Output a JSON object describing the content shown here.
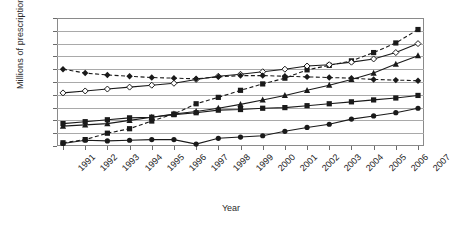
{
  "chart_data": {
    "type": "line",
    "title": "",
    "xlabel": "Year",
    "ylabel": "Millions of prescriptions",
    "grid": true,
    "legend": "none",
    "xlim": [
      1991,
      2007
    ],
    "ylim": [
      0,
      20
    ],
    "ytick_step": 2,
    "yticks": [
      0,
      2,
      4,
      6,
      8,
      10,
      12,
      14,
      16,
      18,
      20
    ],
    "categories": [
      1991,
      1992,
      1993,
      1994,
      1995,
      1996,
      1997,
      1998,
      1999,
      2000,
      2001,
      2002,
      2003,
      2004,
      2005,
      2006,
      2007
    ],
    "xtick_labels": [
      "1991",
      "1992",
      "1993",
      "1994",
      "1995",
      "1996",
      "1997",
      "1998",
      "1999",
      "2000",
      "2001",
      "2002",
      "2003",
      "2004",
      "2005",
      "2006",
      "2007"
    ],
    "series": [
      {
        "name": "series-1",
        "marker": "filled-square",
        "line": "dashed",
        "color": "#1a1a1a",
        "values": [
          0.5,
          1.0,
          2.0,
          2.7,
          3.9,
          5.0,
          6.6,
          7.6,
          8.7,
          9.7,
          10.6,
          11.9,
          12.6,
          13.3,
          14.6,
          16.1,
          18.2
        ]
      },
      {
        "name": "series-2",
        "marker": "open-diamond",
        "line": "solid",
        "color": "#1a1a1a",
        "values": [
          8.3,
          8.6,
          8.9,
          9.2,
          9.5,
          9.8,
          10.4,
          10.9,
          11.2,
          11.6,
          12.0,
          12.5,
          12.7,
          13.1,
          13.6,
          14.6,
          16.0
        ]
      },
      {
        "name": "series-3",
        "marker": "filled-triangle",
        "line": "solid",
        "color": "#1a1a1a",
        "values": [
          3.1,
          3.3,
          3.5,
          4.0,
          4.5,
          5.0,
          5.4,
          5.9,
          6.5,
          7.2,
          7.9,
          8.7,
          9.5,
          10.4,
          11.4,
          12.8,
          14.1
        ]
      },
      {
        "name": "series-4",
        "marker": "filled-diamond",
        "line": "dashed",
        "color": "#1a1a1a",
        "values": [
          12.0,
          11.4,
          11.1,
          10.9,
          10.7,
          10.6,
          10.5,
          10.8,
          11.0,
          11.0,
          10.9,
          10.8,
          10.7,
          10.6,
          10.4,
          10.3,
          10.2
        ]
      },
      {
        "name": "series-5",
        "marker": "filled-square",
        "line": "solid",
        "color": "#1a1a1a",
        "values": [
          3.5,
          3.8,
          4.1,
          4.4,
          4.5,
          4.9,
          5.2,
          5.6,
          5.7,
          5.9,
          6.0,
          6.3,
          6.6,
          6.9,
          7.2,
          7.5,
          7.9
        ]
      },
      {
        "name": "series-6",
        "marker": "filled-circle",
        "line": "solid",
        "color": "#1a1a1a",
        "values": [
          0.4,
          0.9,
          0.8,
          0.9,
          1.0,
          1.0,
          0.3,
          1.2,
          1.4,
          1.6,
          2.3,
          2.9,
          3.4,
          4.2,
          4.7,
          5.2,
          5.9
        ]
      }
    ]
  }
}
